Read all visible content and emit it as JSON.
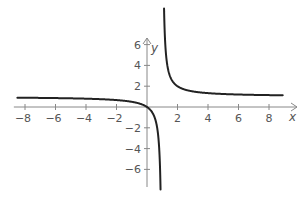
{
  "chart_data": {
    "type": "line",
    "title": "",
    "xlabel": "x",
    "ylabel": "y",
    "xlim": [
      -8.6,
      9.2
    ],
    "ylim": [
      -8,
      9.8
    ],
    "x_ticks": [
      -8,
      -6,
      -4,
      -2,
      2,
      4,
      6,
      8
    ],
    "x_tick_labels": [
      "−8",
      "−6",
      "−4",
      "−2",
      "2",
      "4",
      "6",
      "8"
    ],
    "y_ticks": [
      -6,
      -4,
      -2,
      2,
      4,
      6
    ],
    "y_tick_labels": [
      "−6",
      "−4",
      "−2",
      "2",
      "4",
      "6"
    ],
    "grid": false,
    "legend": null,
    "series": [
      {
        "name": "y = x/(x−1)",
        "description": "Rational function with vertical asymptote x = 1 and horizontal asymptote y = 1; passes through origin",
        "color": "#222222",
        "branches": [
          {
            "x_range": [
              -8.5,
              0.888
            ]
          },
          {
            "x_range": [
              1.118,
              8.9
            ]
          }
        ],
        "sample_points": [
          {
            "x": -8,
            "y": 0.889
          },
          {
            "x": -4,
            "y": 0.8
          },
          {
            "x": -2,
            "y": 0.667
          },
          {
            "x": 0,
            "y": 0
          },
          {
            "x": 0.5,
            "y": -1
          },
          {
            "x": 0.8,
            "y": -4
          },
          {
            "x": 1.2,
            "y": 6
          },
          {
            "x": 2,
            "y": 2
          },
          {
            "x": 4,
            "y": 1.333
          },
          {
            "x": 8,
            "y": 1.143
          }
        ]
      }
    ]
  },
  "colors": {
    "axis": "#888888",
    "curve": "#222222",
    "text": "#555555",
    "background": "#ffffff"
  }
}
